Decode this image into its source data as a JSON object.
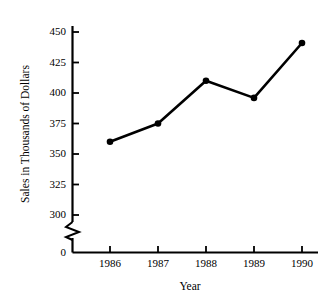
{
  "chart_data": {
    "type": "line",
    "title": "",
    "xlabel": "Year",
    "ylabel": "Sales in Thousands of Dollars",
    "categories": [
      "1986",
      "1987",
      "1988",
      "1989",
      "1990"
    ],
    "values": [
      360,
      375,
      410,
      396,
      441
    ],
    "series": [
      {
        "name": "Sales",
        "values": [
          360,
          375,
          410,
          396,
          441
        ]
      }
    ],
    "ylim": [
      300,
      450
    ],
    "yticks": [
      "0",
      "300",
      "325",
      "350",
      "375",
      "400",
      "425",
      "450"
    ],
    "ytick_values": [
      0,
      300,
      325,
      350,
      375,
      400,
      425,
      450
    ],
    "xticks": [
      "1986",
      "1987",
      "1988",
      "1989",
      "1990"
    ],
    "axis_break": true,
    "axis_break_between": [
      0,
      300
    ],
    "grid": false,
    "legend": false,
    "legend_position": "none",
    "marker": "filled-circle",
    "line_color": "#000000",
    "marker_color": "#000000",
    "background_color": "#ffffff"
  },
  "figure": {
    "y_axis_title": "Sales in Thousands of Dollars",
    "x_axis_title": "Year"
  }
}
